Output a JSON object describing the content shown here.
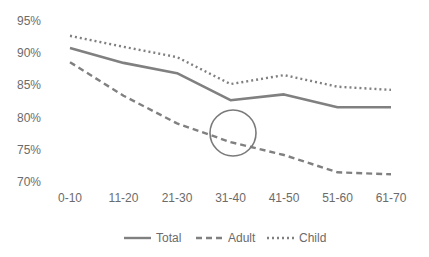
{
  "chart_data": {
    "type": "line",
    "title": "",
    "xlabel": "",
    "ylabel": "",
    "categories": [
      "0-10",
      "11-20",
      "21-30",
      "31-40",
      "41-50",
      "51-60",
      "61-70"
    ],
    "series": [
      {
        "name": "Total",
        "style": "solid",
        "values": [
          90.8,
          88.5,
          86.9,
          82.7,
          83.6,
          81.6,
          81.6
        ]
      },
      {
        "name": "Adult",
        "style": "dashed",
        "values": [
          88.6,
          83.4,
          79.1,
          76.2,
          74.2,
          71.5,
          71.2
        ]
      },
      {
        "name": "Child",
        "style": "dotted",
        "values": [
          92.7,
          91.0,
          89.4,
          85.2,
          86.6,
          84.8,
          84.3
        ]
      }
    ],
    "ylim": [
      70,
      95
    ],
    "yticks": [
      "95%",
      "90%",
      "85%",
      "80%",
      "75%",
      "70%"
    ],
    "grid": false,
    "legend_position": "bottom",
    "annotations": [
      {
        "type": "circle",
        "near_category": "31-40",
        "series": "Adult",
        "description": "circle highlighting Adult line between 21-30 and 31-40"
      }
    ],
    "line_color": "#808080"
  }
}
